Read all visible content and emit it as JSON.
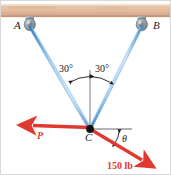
{
  "figure": {
    "colors": {
      "beam": "#e3bb9d",
      "beam_top": "#d9b091",
      "beam_shadow": "#c79a79",
      "anchor": "#9aa3ab",
      "cable": "#7fb9e8",
      "cable_edge": "#2f7fc4",
      "force": "#e03a30",
      "axis": "#5a5a5a",
      "point": "#111111",
      "border": "#d8d8d8"
    }
  },
  "labels": {
    "anchor_left": "A",
    "anchor_right": "B",
    "joint": "C",
    "angle_left": "30°",
    "angle_right": "30°",
    "theta": "θ",
    "force_p": "P",
    "force_magnitude": "150 lb"
  },
  "geometry": {
    "point_c": {
      "x": 89,
      "y": 128
    },
    "anchor_a": {
      "x": 28,
      "y": 22
    },
    "anchor_b": {
      "x": 140,
      "y": 22
    },
    "cable_angle_from_vertical_deg": 30,
    "p_arrow_tip": {
      "x": 26,
      "y": 124
    },
    "load_arrow_tip": {
      "x": 146,
      "y": 164
    },
    "axis_end": {
      "x": 131,
      "y": 128
    },
    "vertical_top": {
      "x": 89,
      "y": 69
    }
  }
}
